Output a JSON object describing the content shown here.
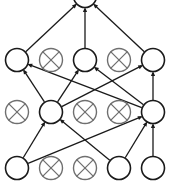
{
  "diagram": {
    "type": "node-link-diagram",
    "canvas": {
      "width": 170,
      "height": 181,
      "background": "#ffffff"
    },
    "style": {
      "node_radius": 11.5,
      "active_node_stroke": "#1a1a1a",
      "inactive_node_stroke": "#6f6f6f",
      "node_fill": "#ffffff",
      "edge_color": "#1a1a1a",
      "edge_width": 1.3,
      "arrow_size": 5
    },
    "legend": {
      "open_circle_meaning": "open-node",
      "crossed_circle_meaning": "crossed-out-node"
    },
    "nodes": [
      {
        "id": "r0c3",
        "row": 0,
        "col": 3,
        "x": 85,
        "y": -4,
        "state": "open",
        "clipped": true
      },
      {
        "id": "r1c1",
        "row": 1,
        "col": 1,
        "x": 17,
        "y": 60,
        "state": "open",
        "clipped": false
      },
      {
        "id": "r1c2",
        "row": 1,
        "col": 2,
        "x": 51,
        "y": 60,
        "state": "crossed",
        "clipped": false
      },
      {
        "id": "r1c3",
        "row": 1,
        "col": 3,
        "x": 85,
        "y": 60,
        "state": "open",
        "clipped": false
      },
      {
        "id": "r1c4",
        "row": 1,
        "col": 4,
        "x": 119,
        "y": 60,
        "state": "crossed",
        "clipped": false
      },
      {
        "id": "r1c5",
        "row": 1,
        "col": 5,
        "x": 153,
        "y": 60,
        "state": "open",
        "clipped": false
      },
      {
        "id": "r2c1",
        "row": 2,
        "col": 1,
        "x": 17,
        "y": 112,
        "state": "crossed",
        "clipped": false
      },
      {
        "id": "r2c2",
        "row": 2,
        "col": 2,
        "x": 51,
        "y": 112,
        "state": "open",
        "clipped": false
      },
      {
        "id": "r2c3",
        "row": 2,
        "col": 3,
        "x": 85,
        "y": 112,
        "state": "crossed",
        "clipped": false
      },
      {
        "id": "r2c4",
        "row": 2,
        "col": 4,
        "x": 119,
        "y": 112,
        "state": "crossed",
        "clipped": false
      },
      {
        "id": "r2c5",
        "row": 2,
        "col": 5,
        "x": 153,
        "y": 112,
        "state": "open",
        "clipped": false
      },
      {
        "id": "r3c1",
        "row": 3,
        "col": 1,
        "x": 17,
        "y": 168,
        "state": "open",
        "clipped": false
      },
      {
        "id": "r3c2",
        "row": 3,
        "col": 2,
        "x": 51,
        "y": 168,
        "state": "crossed",
        "clipped": false
      },
      {
        "id": "r3c3",
        "row": 3,
        "col": 3,
        "x": 85,
        "y": 168,
        "state": "crossed",
        "clipped": false
      },
      {
        "id": "r3c4",
        "row": 3,
        "col": 4,
        "x": 119,
        "y": 168,
        "state": "open",
        "clipped": false
      },
      {
        "id": "r3c5",
        "row": 3,
        "col": 5,
        "x": 153,
        "y": 168,
        "state": "open",
        "clipped": false
      }
    ],
    "edges": [
      {
        "from": "r1c1",
        "to": "r0c3",
        "arrow": true
      },
      {
        "from": "r1c3",
        "to": "r0c3",
        "arrow": true
      },
      {
        "from": "r1c5",
        "to": "r0c3",
        "arrow": true
      },
      {
        "from": "r2c2",
        "to": "r1c1",
        "arrow": true
      },
      {
        "from": "r2c5",
        "to": "r1c1",
        "arrow": true
      },
      {
        "from": "r2c2",
        "to": "r1c3",
        "arrow": true
      },
      {
        "from": "r2c5",
        "to": "r1c3",
        "arrow": true
      },
      {
        "from": "r2c2",
        "to": "r1c5",
        "arrow": true
      },
      {
        "from": "r2c5",
        "to": "r1c5",
        "arrow": true
      },
      {
        "from": "r3c1",
        "to": "r2c2",
        "arrow": true
      },
      {
        "from": "r3c4",
        "to": "r2c2",
        "arrow": true
      },
      {
        "from": "r3c1",
        "to": "r2c5",
        "arrow": true
      },
      {
        "from": "r3c4",
        "to": "r2c5",
        "arrow": true
      },
      {
        "from": "r3c5",
        "to": "r2c5",
        "arrow": true
      }
    ]
  }
}
